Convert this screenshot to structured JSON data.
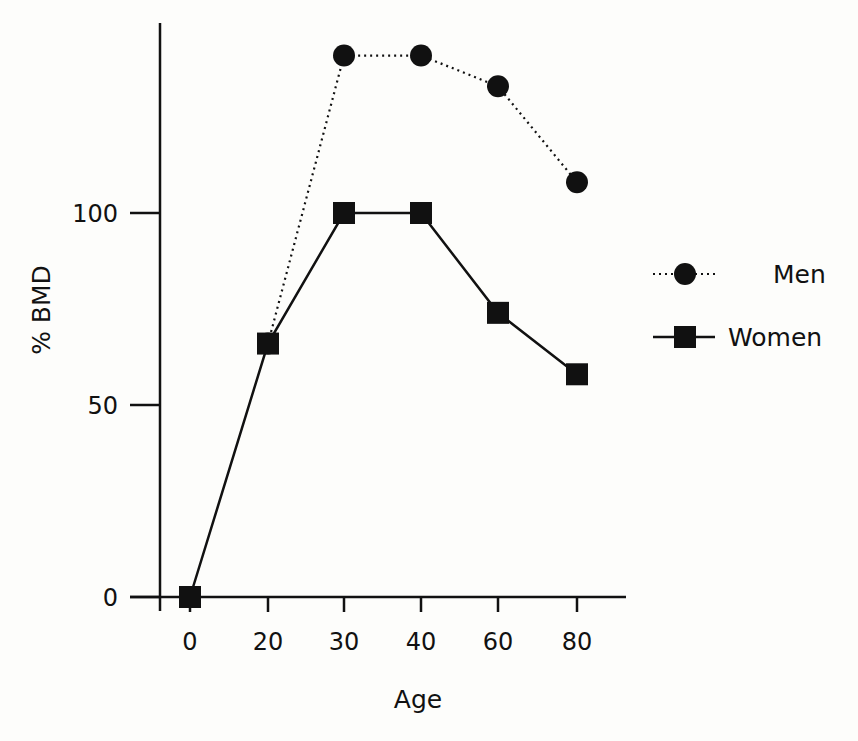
{
  "chart_data": {
    "type": "line",
    "title": "",
    "xlabel": "Age",
    "ylabel": "% BMD",
    "categories": [
      "0",
      "20",
      "30",
      "40",
      "60",
      "80"
    ],
    "x": [
      0,
      20,
      30,
      40,
      60,
      80
    ],
    "series": [
      {
        "name": "Men",
        "marker": "circle",
        "line_style": "dotted",
        "values": [
          null,
          66,
          141,
          141,
          133,
          108
        ]
      },
      {
        "name": "Women",
        "marker": "square",
        "line_style": "solid",
        "values": [
          0,
          66,
          100,
          100,
          74,
          58
        ]
      }
    ],
    "yticks": [
      0,
      50,
      100
    ],
    "ylim": [
      0,
      150
    ],
    "grid": false,
    "legend_position": "right",
    "colors": {
      "line": "#111111",
      "background": "#fdfdfb"
    }
  },
  "axes": {
    "x_tick_labels": [
      "0",
      "20",
      "30",
      "40",
      "60",
      "80"
    ],
    "y_tick_labels": [
      "0",
      "50",
      "100"
    ],
    "x_title": "Age",
    "y_title": "% BMD"
  },
  "legend": {
    "men_label": "Men",
    "women_label": "Women"
  }
}
